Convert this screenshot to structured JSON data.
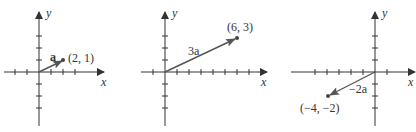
{
  "figure": {
    "panels": [
      {
        "id": "a",
        "vector_label": "a",
        "vector_label_bold": true,
        "point_label": "(2, 1)",
        "point": [
          2,
          1
        ],
        "x_axis_label": "x",
        "y_axis_label": "y"
      },
      {
        "id": "3a",
        "vector_label": "3a",
        "point_label": "(6, 3)",
        "point": [
          6,
          3
        ],
        "x_axis_label": "x",
        "y_axis_label": "y"
      },
      {
        "id": "-2a",
        "vector_label": "−2a",
        "point_label": "(−4, −2)",
        "point": [
          -4,
          -2
        ],
        "x_axis_label": "x",
        "y_axis_label": "y"
      }
    ],
    "colors": {
      "axis": "#333333",
      "vector": "#555555",
      "text": "#333333"
    }
  }
}
